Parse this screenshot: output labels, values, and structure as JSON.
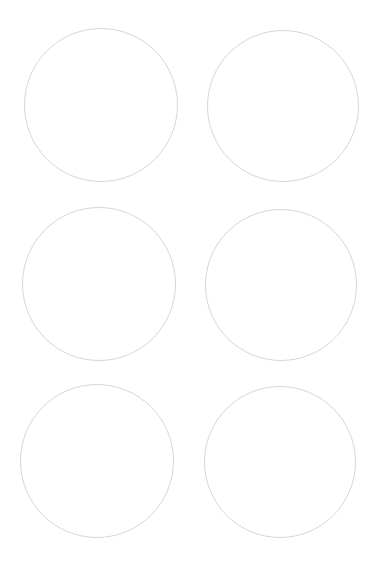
{
  "page": {
    "background": "#ffffff",
    "stroke_color": "#d6d6d6"
  },
  "circles": [
    {
      "id": "circle-1",
      "row": 1,
      "col": 1,
      "left": 24,
      "top": 28,
      "size": 154
    },
    {
      "id": "circle-2",
      "row": 1,
      "col": 2,
      "left": 207,
      "top": 30,
      "size": 152
    },
    {
      "id": "circle-3",
      "row": 2,
      "col": 1,
      "left": 22,
      "top": 207,
      "size": 154
    },
    {
      "id": "circle-4",
      "row": 2,
      "col": 2,
      "left": 205,
      "top": 209,
      "size": 152
    },
    {
      "id": "circle-5",
      "row": 3,
      "col": 1,
      "left": 20,
      "top": 384,
      "size": 154
    },
    {
      "id": "circle-6",
      "row": 3,
      "col": 2,
      "left": 204,
      "top": 386,
      "size": 152
    }
  ]
}
